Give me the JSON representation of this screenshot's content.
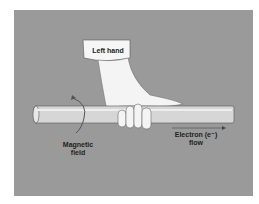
{
  "figure": {
    "labels": {
      "hand": "Left hand",
      "field_line1": "Magnetic",
      "field_line2": "field",
      "flow_line1": "Electron (e⁻)",
      "flow_line2": "flow"
    },
    "colors": {
      "background": "#9a9a9a",
      "rod": "#d8d8d8",
      "hand": "#f4f4f4"
    }
  }
}
